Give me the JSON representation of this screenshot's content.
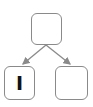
{
  "diagram": {
    "type": "tree",
    "nodes": [
      {
        "id": "root",
        "label": ""
      },
      {
        "id": "left",
        "label": "I"
      },
      {
        "id": "right",
        "label": ""
      }
    ],
    "edges": [
      {
        "from": "root",
        "to": "left"
      },
      {
        "from": "root",
        "to": "right"
      }
    ],
    "colors": {
      "stroke": "#8a8a8a",
      "text": "#111111"
    }
  }
}
